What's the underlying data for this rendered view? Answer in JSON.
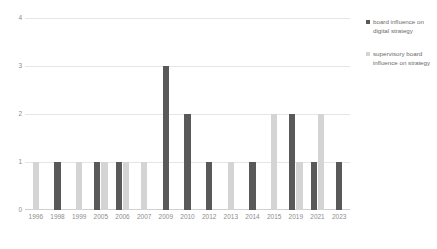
{
  "chart_data": {
    "type": "bar",
    "title": "",
    "subtitle": "",
    "xlabel": "",
    "ylabel": "",
    "ylim": [
      0,
      4
    ],
    "y_ticks": [
      "0",
      "1",
      "2",
      "3",
      "4"
    ],
    "grid": true,
    "legend_position": "right",
    "categories": [
      "1996",
      "1998",
      "1999",
      "2005",
      "2006",
      "2007",
      "2009",
      "2010",
      "2012",
      "2013",
      "2014",
      "2015",
      "2019",
      "2021",
      "2023"
    ],
    "series": [
      {
        "name": "board influence on digital strategy",
        "color": "#595959",
        "values": [
          0,
          1,
          0,
          1,
          1,
          0,
          3,
          2,
          1,
          0,
          1,
          0,
          2,
          1,
          1
        ]
      },
      {
        "name": "supervisory board influence on strategy",
        "color": "#d4d4d4",
        "values": [
          1,
          0,
          1,
          1,
          1,
          1,
          0,
          0,
          0,
          1,
          0,
          2,
          1,
          2,
          0
        ]
      }
    ]
  },
  "legend": {
    "entries": [
      {
        "label": "board influence on digital strategy",
        "color": "#595959"
      },
      {
        "label": "supervisory board influence on strategy",
        "color": "#d4d4d4"
      }
    ]
  }
}
